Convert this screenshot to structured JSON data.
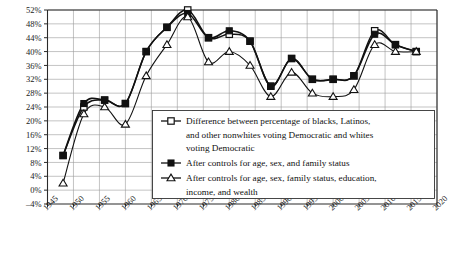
{
  "chart_data": {
    "type": "line",
    "title": "",
    "subtitle": "",
    "xlabel": "",
    "ylabel": "",
    "xlim": [
      1945,
      2020
    ],
    "ylim": [
      -4,
      52
    ],
    "ytick_labels": [
      "52%",
      "48%",
      "44%",
      "40%",
      "36%",
      "32%",
      "28%",
      "24%",
      "20%",
      "16%",
      "12%",
      "8%",
      "4%",
      "0%",
      "–4%"
    ],
    "ytick_values": [
      52,
      48,
      44,
      40,
      36,
      32,
      28,
      24,
      20,
      16,
      12,
      8,
      4,
      0,
      -4
    ],
    "xtick_labels": [
      "1945",
      "1950",
      "1955",
      "1960",
      "1965",
      "1970",
      "1975",
      "1980",
      "1985",
      "1990",
      "1995",
      "2000",
      "2005",
      "2010",
      "2015",
      "2020"
    ],
    "xtick_values": [
      1945,
      1950,
      1955,
      1960,
      1965,
      1970,
      1975,
      1980,
      1985,
      1990,
      1995,
      2000,
      2005,
      2010,
      2015,
      2020
    ],
    "grid": true,
    "legend_position": "inside-center-bottom",
    "x": [
      1948,
      1952,
      1956,
      1960,
      1964,
      1968,
      1972,
      1976,
      1980,
      1984,
      1988,
      1992,
      1996,
      2000,
      2004,
      2008,
      2012,
      2016
    ],
    "series": [
      {
        "name": "Difference between percentage of blacks, Latinos, and other nonwhites voting Democratic and whites voting Democratic",
        "marker": "open-square",
        "values": [
          10,
          24,
          26,
          25,
          40,
          47,
          52,
          44,
          45,
          43,
          30,
          38,
          32,
          32,
          33,
          46,
          42,
          40
        ]
      },
      {
        "name": "After controls for age, sex, and family status",
        "marker": "filled-square",
        "values": [
          10,
          25,
          26,
          25,
          40,
          47,
          51,
          44,
          46,
          43,
          30,
          38,
          32,
          32,
          33,
          45,
          42,
          40
        ]
      },
      {
        "name": "After controls for age, sex, family status, education, income, and wealth",
        "marker": "open-triangle",
        "values": [
          2,
          22,
          24,
          19,
          33,
          42,
          50,
          37,
          40,
          36,
          27,
          34,
          28,
          27,
          29,
          42,
          40,
          40
        ]
      }
    ]
  },
  "legend": {
    "entries": [
      {
        "marker": "open-square",
        "lines": [
          "Difference between percentage of blacks, Latinos,",
          "and other nonwhites voting Democratic and whites",
          "voting Democratic"
        ]
      },
      {
        "marker": "filled-square",
        "lines": [
          "After controls for age, sex, and family status"
        ]
      },
      {
        "marker": "open-triangle",
        "lines": [
          "After controls for age, sex, family status, education,",
          "income, and wealth"
        ]
      }
    ]
  },
  "style": {
    "ink": "#111111",
    "grid_color": "#9a9a9a",
    "background": "#ffffff"
  }
}
